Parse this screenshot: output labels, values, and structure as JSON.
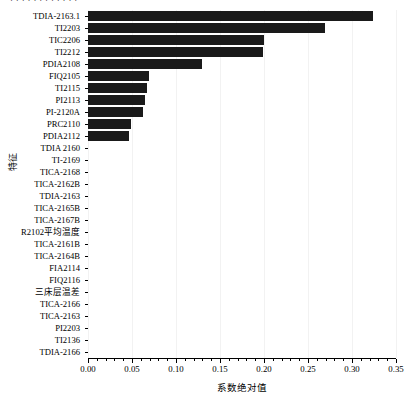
{
  "figure": {
    "top_artifact_text": "· · · · · · · · · · · ·"
  },
  "axes": {
    "xlabel": "系数绝对值",
    "ylabel": "特征",
    "xticks": [
      "0.00",
      "0.05",
      "0.10",
      "0.15",
      "0.20",
      "0.25",
      "0.30",
      "0.35"
    ],
    "bar_color": "#1a1a1a",
    "grid_color": "#f2f2f2"
  },
  "chart_data": {
    "type": "bar",
    "orientation": "horizontal",
    "title": "",
    "xlabel": "系数绝对值",
    "ylabel": "特征",
    "xlim": [
      0.0,
      0.35
    ],
    "xticks": [
      0.0,
      0.05,
      0.1,
      0.15,
      0.2,
      0.25,
      0.3,
      0.35
    ],
    "minor_tick_interval": 0.01,
    "grid": false,
    "legend": null,
    "categories": [
      "TDIA-2163.1",
      "TI2203",
      "TIC2206",
      "TI2212",
      "PDIA2108",
      "FIQ2105",
      "TI2115",
      "PI2113",
      "PI-2120A",
      "PRC2110",
      "PDIA2112",
      "TDIA 2160",
      "TI-2169",
      "TICA-2168",
      "TICA-2162B",
      "TDIA-2163",
      "TICA-2165B",
      "TICA-2167B",
      "R2102平均温度",
      "TICA-2161B",
      "TICA-2164B",
      "FIA2114",
      "FIQ2116",
      "三床层温差",
      "TICA-2166",
      "TICA-2163",
      "PI2203",
      "TI2136",
      "TDIA-2166"
    ],
    "values": [
      0.324,
      0.269,
      0.2,
      0.199,
      0.13,
      0.069,
      0.067,
      0.065,
      0.062,
      0.049,
      0.047,
      0.0,
      0.0,
      0.0,
      0.0,
      0.0,
      0.0,
      0.0,
      0.0,
      0.0,
      0.0,
      0.0,
      0.0,
      0.0,
      0.0,
      0.0,
      0.0,
      0.0,
      0.0
    ]
  }
}
